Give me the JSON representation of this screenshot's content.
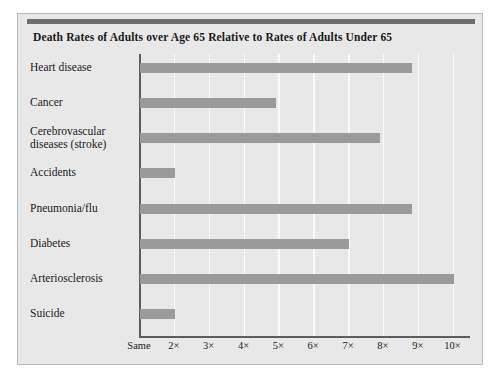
{
  "chart_data": {
    "type": "bar",
    "orientation": "horizontal",
    "title": "Death Rates of Adults over Age 65 Relative to Rates of Adults Under 65",
    "xlabel": "",
    "ylabel": "",
    "categories": [
      "Heart disease",
      "Cancer",
      "Cerebrovascular diseases (stroke)",
      "Accidents",
      "Pneumonia/flu",
      "Diabetes",
      "Arteriosclerosis",
      "Suicide"
    ],
    "values": [
      8.8,
      4.9,
      7.9,
      2.0,
      8.8,
      7.0,
      10.0,
      2.0
    ],
    "value_unit": "x",
    "xlim": [
      1,
      10.5
    ],
    "xticks": [
      1,
      2,
      3,
      4,
      5,
      6,
      7,
      8,
      9,
      10
    ],
    "xticklabels": [
      "Same",
      "2×",
      "3×",
      "4×",
      "5×",
      "6×",
      "7×",
      "8×",
      "9×",
      "10×"
    ],
    "grid": true,
    "legend": false,
    "bar_color": "#9a9a9a",
    "panel_color": "#e8e8e8",
    "gridline_color": "#fbfbfb",
    "axis_color": "#5d5d5d",
    "accent_color": "#6e6e6e"
  },
  "categories_display": [
    {
      "line1": "Heart disease",
      "line2": ""
    },
    {
      "line1": "Cancer",
      "line2": ""
    },
    {
      "line1": "Cerebrovascular",
      "line2": "diseases (stroke)"
    },
    {
      "line1": "Accidents",
      "line2": ""
    },
    {
      "line1": "Pneumonia/flu",
      "line2": ""
    },
    {
      "line1": "Diabetes",
      "line2": ""
    },
    {
      "line1": "Arteriosclerosis",
      "line2": ""
    },
    {
      "line1": "Suicide",
      "line2": ""
    }
  ]
}
